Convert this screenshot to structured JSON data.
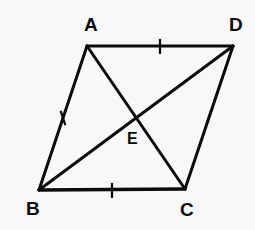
{
  "figure": {
    "background_color": "#f8f8f8",
    "stroke_color": "#0b0b0b",
    "label_color": "#0b0b0b",
    "side_stroke_width": 3,
    "diagonal_stroke_width": 3,
    "tick_stroke_width": 2,
    "vertices": [
      {
        "name": "A",
        "label": "A",
        "x": 87,
        "y": 46,
        "label_x": 84,
        "label_y": 15
      },
      {
        "name": "D",
        "label": "D",
        "x": 233,
        "y": 46,
        "label_x": 229,
        "label_y": 15
      },
      {
        "name": "B",
        "label": "B",
        "x": 39,
        "y": 190,
        "label_x": 26,
        "label_y": 199
      },
      {
        "name": "C",
        "label": "C",
        "x": 185,
        "y": 189,
        "label_x": 180,
        "label_y": 200
      }
    ],
    "interior_points": [
      {
        "name": "E",
        "label": "E",
        "x": 133,
        "y": 116,
        "label_x": 127,
        "label_y": 131,
        "description": "intersection of diagonals AC and BD"
      }
    ],
    "sides": [
      {
        "name": "AD",
        "from": "A",
        "to": "D",
        "tick_marks": 1
      },
      {
        "name": "AB",
        "from": "A",
        "to": "B",
        "tick_marks": 1
      },
      {
        "name": "BC",
        "from": "B",
        "to": "C",
        "tick_marks": 1
      },
      {
        "name": "DC",
        "from": "D",
        "to": "C",
        "tick_marks": 1
      }
    ],
    "diagonals": [
      {
        "name": "AC",
        "from": "A",
        "to": "C"
      },
      {
        "name": "BD",
        "from": "B",
        "to": "D"
      }
    ],
    "tick_marks": [
      {
        "name": "tick-AD",
        "on_side": "AD",
        "x": 160,
        "y": 46,
        "angle_deg": 0,
        "length": 15
      },
      {
        "name": "tick-AB",
        "on_side": "AB",
        "x": 63,
        "y": 118,
        "angle_deg": 71.6,
        "length": 15
      },
      {
        "name": "tick-BC",
        "on_side": "BC",
        "x": 112,
        "y": 190,
        "angle_deg": 0,
        "length": 15
      },
      {
        "name": "tick-DC",
        "on_side": "DC",
        "x": 209,
        "y": 117,
        "angle_deg": -71.6,
        "length": 15
      }
    ]
  }
}
